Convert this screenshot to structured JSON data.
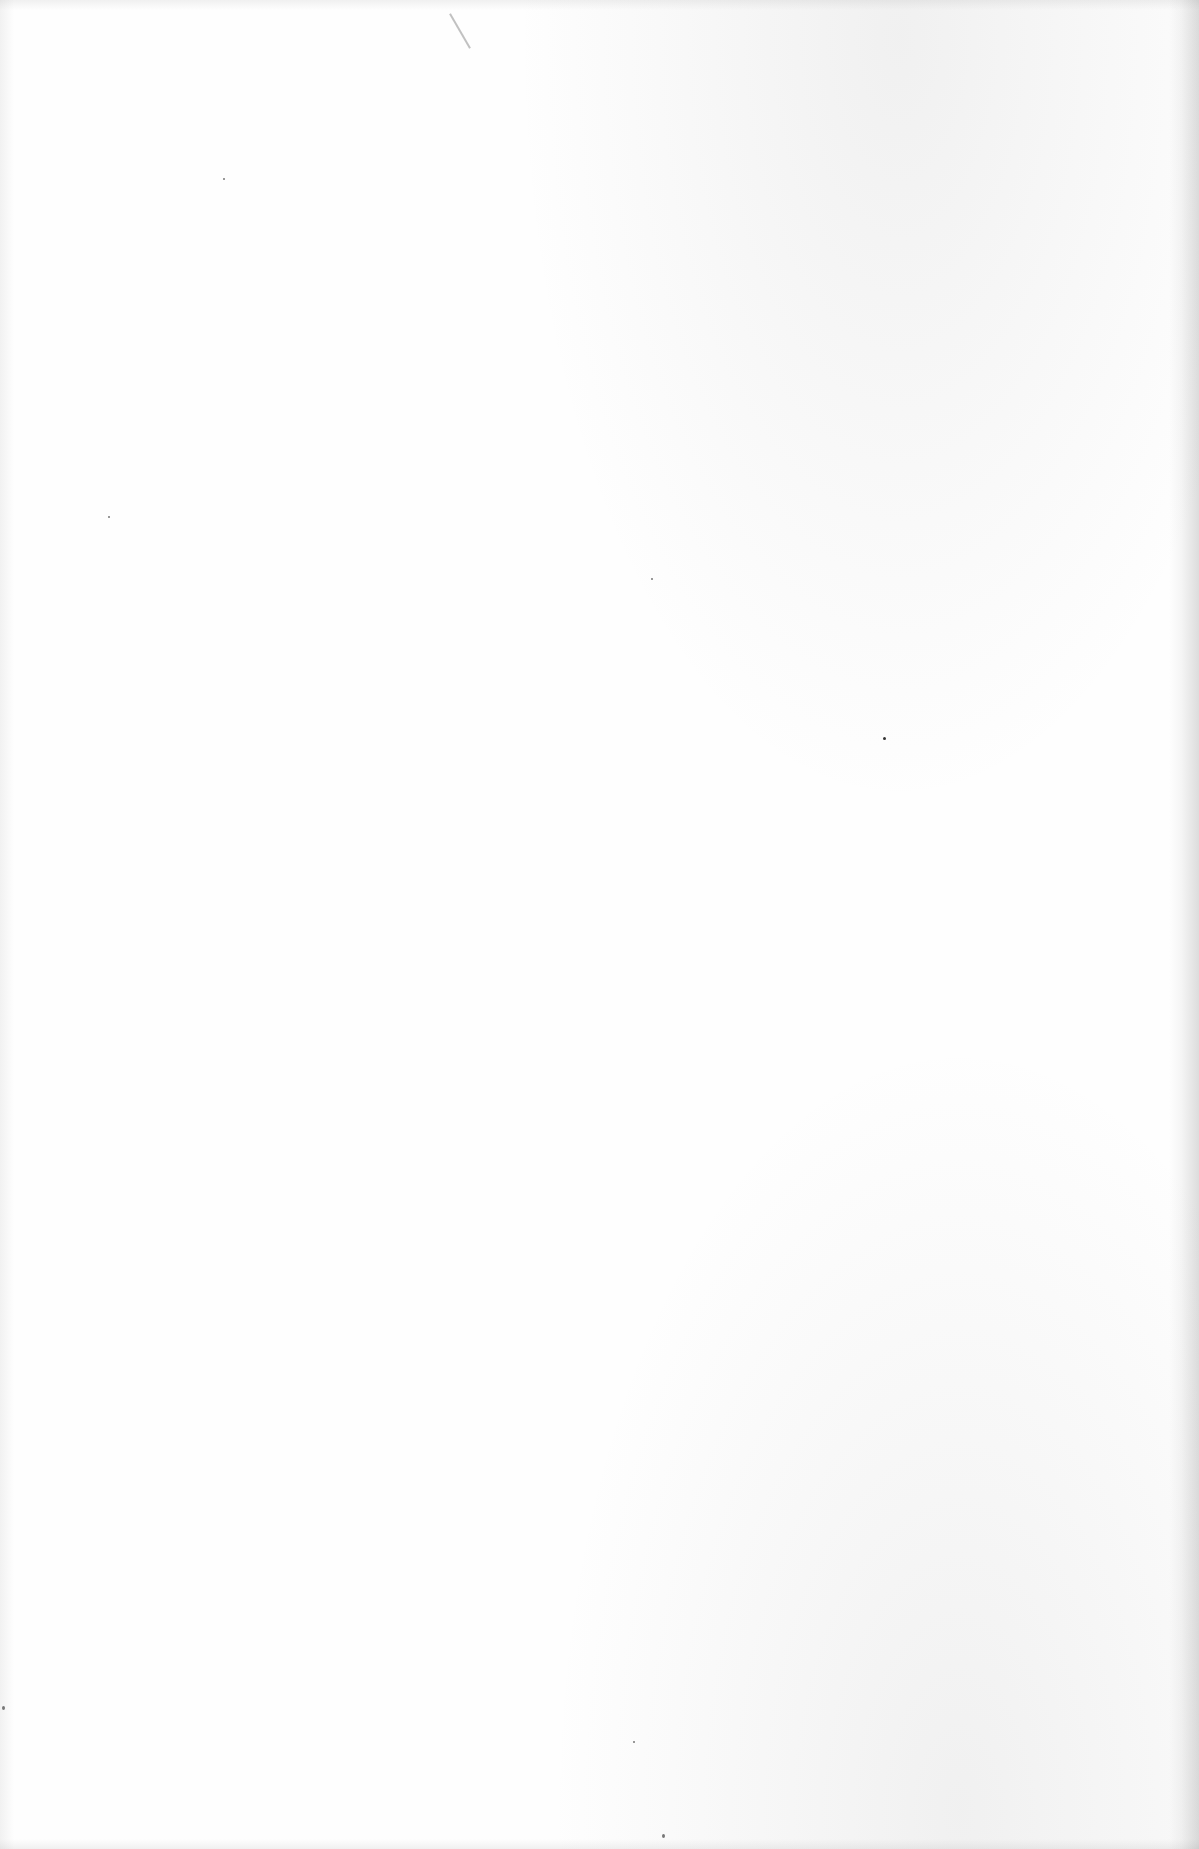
{
  "page": {
    "content": ""
  }
}
